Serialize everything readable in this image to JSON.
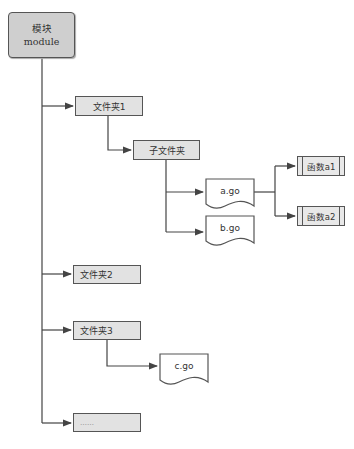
{
  "diagram": {
    "root": {
      "line1": "模块",
      "line2": "module"
    },
    "folders": [
      {
        "label": "文件夹1"
      },
      {
        "label": "文件夹2"
      },
      {
        "label": "文件夹3"
      },
      {
        "label": "……"
      }
    ],
    "subfolder": {
      "label": "子文件夹"
    },
    "files": {
      "a": "a.go",
      "b": "b.go",
      "c": "c.go"
    },
    "functions": [
      {
        "label": "函数a1"
      },
      {
        "label": "函数a2"
      }
    ],
    "colors": {
      "box_fill": "#e2e2e2",
      "root_fill": "#cfcfcf",
      "stroke": "#555555"
    }
  }
}
